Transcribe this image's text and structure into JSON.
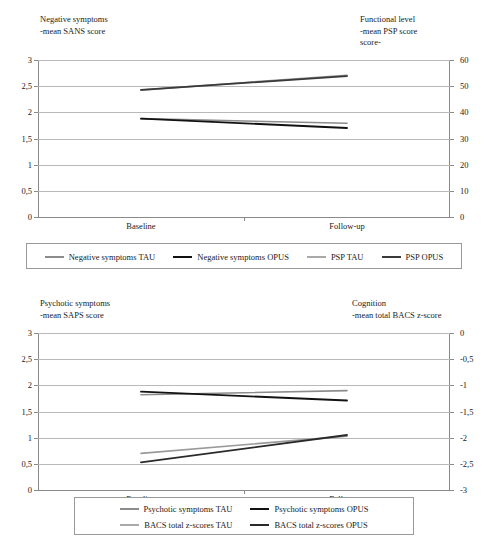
{
  "figure": {
    "panels": [
      {
        "id": "panel-1",
        "left_axis_title": "Negative symptoms\n-mean SANS score",
        "right_axis_title": "Functional level\n-mean PSP score\nscore-",
        "chart_data": {
          "type": "line",
          "title": "",
          "categories": [
            "Baseline",
            "Follow-up"
          ],
          "x": [
            "Baseline",
            "Follow-up"
          ],
          "xlabel": "",
          "left_axis": {
            "label": "Negative symptoms -mean SANS score",
            "ticks": [
              "0",
              "0,5",
              "1",
              "1,5",
              "2",
              "2,5",
              "3"
            ],
            "tickvalues": [
              0,
              0.5,
              1,
              1.5,
              2,
              2.5,
              3
            ],
            "ylim": [
              0,
              3
            ]
          },
          "right_axis": {
            "label": "Functional level -mean PSP score score-",
            "ticks": [
              "0",
              "10",
              "20",
              "30",
              "40",
              "50",
              "60"
            ],
            "tickvalues": [
              0,
              10,
              20,
              30,
              40,
              50,
              60
            ],
            "ylim": [
              0,
              60
            ]
          },
          "grid": true,
          "legend_position": "below",
          "series": [
            {
              "name": "Negative symptoms TAU",
              "axis": "left",
              "values": [
                1.88,
                1.79
              ],
              "color": "#8c8c8c",
              "width": 1.6
            },
            {
              "name": "Negative symptoms OPUS",
              "axis": "left",
              "values": [
                1.88,
                1.7
              ],
              "color": "#121212",
              "width": 1.8
            },
            {
              "name": "PSP TAU",
              "axis": "right",
              "values": [
                48.5,
                54.2
              ],
              "color": "#8c8c8c",
              "width": 1.6
            },
            {
              "name": "PSP OPUS",
              "axis": "right",
              "values": [
                48.6,
                53.8
              ],
              "color": "#3a3a3a",
              "width": 1.8
            }
          ]
        },
        "legend": {
          "rows": [
            [
              {
                "label": "Negative symptoms TAU",
                "color": "#8c8c8c",
                "width": 1.6
              },
              {
                "label": "Negative symptoms OPUS",
                "color": "#121212",
                "width": 2.2
              },
              {
                "label": "PSP TAU",
                "color": "#a9a9a9",
                "width": 1.4
              },
              {
                "label": "PSP OPUS",
                "color": "#3a3a3a",
                "width": 2.2
              }
            ]
          ]
        }
      },
      {
        "id": "panel-2",
        "left_axis_title": "Psychotic symptoms\n-mean SAPS score",
        "right_axis_title": "Cognition\n-mean total BACS z-score",
        "chart_data": {
          "type": "line",
          "title": "",
          "categories": [
            "Baseline",
            "Follow-up"
          ],
          "x": [
            "Baseline",
            "Follow-up"
          ],
          "xlabel": "",
          "left_axis": {
            "label": "Psychotic symptoms -mean SAPS score",
            "ticks": [
              "0",
              "0,5",
              "1",
              "1,5",
              "2",
              "2,5",
              "3"
            ],
            "tickvalues": [
              0,
              0.5,
              1,
              1.5,
              2,
              2.5,
              3
            ],
            "ylim": [
              0,
              3
            ]
          },
          "right_axis": {
            "label": "Cognition -mean total BACS z-score",
            "ticks": [
              "-3",
              "-2,5",
              "-2",
              "-1,5",
              "-1",
              "-0,5",
              "0"
            ],
            "tickvalues": [
              -3,
              -2.5,
              -2,
              -1.5,
              -1,
              -0.5,
              0
            ],
            "ylim": [
              -3,
              0
            ]
          },
          "grid": true,
          "legend_position": "below",
          "series": [
            {
              "name": "Psychotic symptoms TAU",
              "axis": "left",
              "values": [
                1.82,
                1.9
              ],
              "color": "#8c8c8c",
              "width": 1.6
            },
            {
              "name": "Psychotic symptoms OPUS",
              "axis": "left",
              "values": [
                1.88,
                1.71
              ],
              "color": "#121212",
              "width": 1.8
            },
            {
              "name": "BACS total z-scores TAU",
              "axis": "right",
              "values": [
                -2.3,
                -1.97
              ],
              "color": "#9a9a9a",
              "width": 1.6
            },
            {
              "name": "BACS total z-scores OPUS",
              "axis": "right",
              "values": [
                -2.47,
                -1.95
              ],
              "color": "#2a2a2a",
              "width": 1.8
            }
          ]
        },
        "legend": {
          "rows": [
            [
              {
                "label": "Psychotic symptoms TAU",
                "color": "#8c8c8c",
                "width": 1.6
              },
              {
                "label": "Psychotic symptoms OPUS",
                "color": "#121212",
                "width": 2.2
              }
            ],
            [
              {
                "label": "BACS total z-scores TAU",
                "color": "#a9a9a9",
                "width": 1.4
              },
              {
                "label": "BACS total z-scores OPUS",
                "color": "#2a2a2a",
                "width": 2.2
              }
            ]
          ]
        }
      }
    ]
  }
}
